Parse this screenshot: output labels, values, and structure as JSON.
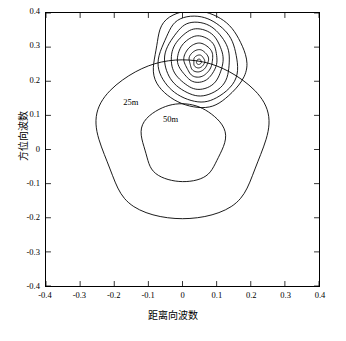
{
  "chart_data": {
    "type": "line",
    "title": "",
    "xlabel": "距离向波数",
    "ylabel": "方位向波数",
    "xlim": [
      -0.4,
      0.4
    ],
    "ylim": [
      -0.4,
      0.4
    ],
    "grid": false,
    "legend": null,
    "xticks": [
      "-0.4",
      "-0.3",
      "-0.2",
      "-0.1",
      "0",
      "0.1",
      "0.2",
      "0.3",
      "0.4"
    ],
    "yticks": [
      "0.4",
      "0.3",
      "0.2",
      "0.1",
      "0",
      "-0.1",
      "-0.2",
      "-0.3",
      "-0.4"
    ],
    "xtick_values": [
      -0.4,
      -0.3,
      -0.2,
      -0.1,
      0,
      0.1,
      0.2,
      0.3,
      0.4
    ],
    "ytick_values": [
      0.4,
      0.3,
      0.2,
      0.1,
      0,
      -0.1,
      -0.2,
      -0.3,
      -0.4
    ],
    "annotations": [
      {
        "label": "25m",
        "x": -0.175,
        "y": 0.135
      },
      {
        "label": "50m",
        "x": -0.06,
        "y": 0.085
      }
    ],
    "series": [
      {
        "name": "contour-outer-25m",
        "type": "closed_curve",
        "center": [
          0.0,
          0.03
        ],
        "rx": 0.245,
        "ry": 0.245
      },
      {
        "name": "contour-inner-50m",
        "type": "closed_curve",
        "center": [
          0.0,
          0.02
        ],
        "rx": 0.12,
        "ry": 0.12
      },
      {
        "name": "contour-peak-1",
        "type": "closed_curve",
        "center": [
          0.045,
          0.265
        ],
        "rx": 0.135,
        "ry": 0.145
      },
      {
        "name": "contour-peak-2",
        "type": "closed_curve",
        "center": [
          0.045,
          0.265
        ],
        "rx": 0.115,
        "ry": 0.125
      },
      {
        "name": "contour-peak-3",
        "type": "closed_curve",
        "center": [
          0.045,
          0.265
        ],
        "rx": 0.095,
        "ry": 0.105
      },
      {
        "name": "contour-peak-4",
        "type": "closed_curve",
        "center": [
          0.045,
          0.265
        ],
        "rx": 0.076,
        "ry": 0.085
      },
      {
        "name": "contour-peak-5",
        "type": "closed_curve",
        "center": [
          0.045,
          0.265
        ],
        "rx": 0.058,
        "ry": 0.065
      },
      {
        "name": "contour-peak-6",
        "type": "closed_curve",
        "center": [
          0.047,
          0.262
        ],
        "rx": 0.042,
        "ry": 0.048
      },
      {
        "name": "contour-peak-7",
        "type": "closed_curve",
        "center": [
          0.047,
          0.26
        ],
        "rx": 0.028,
        "ry": 0.032
      },
      {
        "name": "contour-peak-8",
        "type": "closed_curve",
        "center": [
          0.048,
          0.258
        ],
        "rx": 0.016,
        "ry": 0.019
      },
      {
        "name": "contour-peak-9",
        "type": "closed_curve",
        "center": [
          0.048,
          0.257
        ],
        "rx": 0.007,
        "ry": 0.008
      }
    ],
    "colors": {
      "line": "#000000",
      "axis": "#000000",
      "background": "#ffffff"
    }
  }
}
